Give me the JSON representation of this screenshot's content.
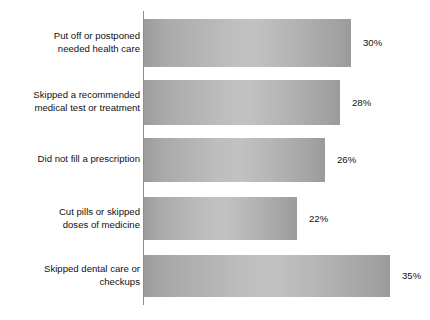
{
  "chart_data": {
    "type": "bar",
    "orientation": "horizontal",
    "title": "",
    "subtitle": "",
    "xlabel": "",
    "ylabel": "",
    "grid": false,
    "legend": null,
    "xlim": [
      0,
      38
    ],
    "axis_line": "category axis at left of bars",
    "value_suffix": "%",
    "categories": [
      "Put off or postponed\nneeded health care",
      "Skipped a recommended\nmedical test or treatment",
      "Did not fill a prescription",
      "Cut pills or skipped\ndoses of medicine",
      "Skipped dental care or\ncheckups"
    ],
    "values": [
      30,
      28,
      26,
      22,
      35
    ],
    "value_labels": [
      "30%",
      "28%",
      "26%",
      "22%",
      "35%"
    ],
    "colors": {
      "bar_edge": "#9c9c9c",
      "bar_center": "#c2c2c2",
      "axis": "#8d8d8d",
      "text": "#111111",
      "background": "#ffffff"
    }
  },
  "bars": [
    {
      "label": "Put off or postponed\nneeded health care",
      "value_label": "30%",
      "top": 19,
      "height": 48,
      "width": 207,
      "label_top": 30
    },
    {
      "label": "Skipped a recommended\nmedical test or treatment",
      "value_label": "28%",
      "top": 80,
      "height": 45,
      "width": 196,
      "label_top": 89
    },
    {
      "label": "Did not fill a prescription",
      "value_label": "26%",
      "top": 138,
      "height": 44,
      "width": 181,
      "label_top": 153
    },
    {
      "label": "Cut pills or skipped\ndoses of medicine",
      "value_label": "22%",
      "top": 197,
      "height": 43,
      "width": 153,
      "label_top": 206
    },
    {
      "label": "Skipped dental care or\ncheckups",
      "value_label": "35%",
      "top": 255,
      "height": 42,
      "width": 246,
      "label_top": 263
    }
  ]
}
